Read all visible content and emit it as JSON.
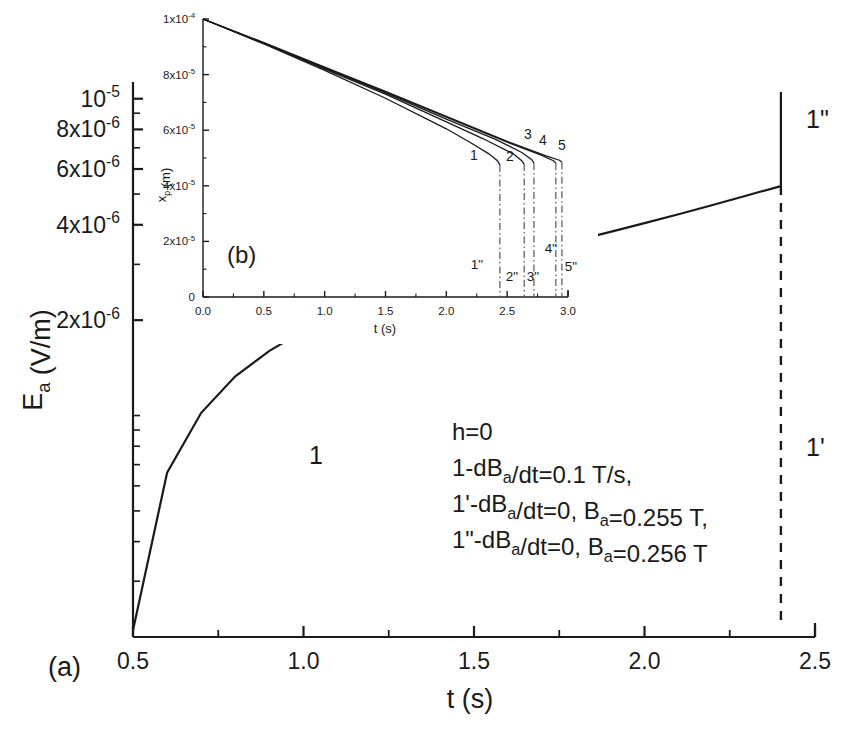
{
  "figure": {
    "panel_a_label": "(a)",
    "panel_b_label": "(b)"
  },
  "main": {
    "xlabel": "t (s)",
    "ylabel_main": "E",
    "ylabel_sub": "a",
    "ylabel_unit": " (V/m)",
    "xticks": [
      "0.5",
      "1.0",
      "1.5",
      "2.0",
      "2.5"
    ],
    "yticks": [
      {
        "label_mant": "2x10",
        "label_exp": "-6"
      },
      {
        "label_mant": "4x10",
        "label_exp": "-6"
      },
      {
        "label_mant": "6x10",
        "label_exp": "-6"
      },
      {
        "label_mant": "8x10",
        "label_exp": "-6"
      },
      {
        "label_mant": "10",
        "label_exp": "-5"
      }
    ],
    "curve_labels": {
      "one": "1",
      "one_prime": "1'",
      "one_dprime": "1\""
    },
    "annotation": [
      "h=0",
      "1-dB|a|/dt=0.1 T/s,",
      "1'-dB|a|/dt=0, B|a|=0.255 T,",
      "1\"-dB|a|/dt=0, B|a|=0.256 T"
    ]
  },
  "inset": {
    "xlabel": "t (s)",
    "ylabel_main": "x",
    "ylabel_sub": "p",
    "ylabel_unit": " (m)",
    "xticks": [
      "0.0",
      "0.5",
      "1.0",
      "1.5",
      "2.0",
      "2.5",
      "3.0"
    ],
    "yticks": [
      {
        "label": "0",
        "mant": "0",
        "exp": ""
      },
      {
        "label": "2x10-5",
        "mant": "2x10",
        "exp": "-5"
      },
      {
        "label": "4x10-5",
        "mant": "4x10",
        "exp": "-5"
      },
      {
        "label": "6x10-5",
        "mant": "6x10",
        "exp": "-5"
      },
      {
        "label": "8x10-5",
        "mant": "8x10",
        "exp": "-5"
      },
      {
        "label": "1x10-4",
        "mant": "1x10",
        "exp": "-4"
      }
    ],
    "curve_labels": [
      "1",
      "2",
      "3",
      "4",
      "5"
    ],
    "drop_labels": [
      "1\"",
      "2\"",
      "3\"",
      "4\"",
      "5\""
    ]
  },
  "colors": {
    "ink": "#1a1a1a",
    "dashdot": "#555555",
    "background": "#ffffff"
  },
  "chart_data": {
    "type": "line",
    "title": "",
    "panels": [
      {
        "id": "a",
        "label": "(a)",
        "xlabel": "t (s)",
        "ylabel": "E_a (V/m)",
        "xscale": "linear",
        "yscale": "log",
        "xlim": [
          0.5,
          2.5
        ],
        "ylim": [
          2e-07,
          1.05e-05
        ],
        "grid": false,
        "legend": "inline-curve-labels",
        "series": [
          {
            "name": "1",
            "note": "dB_a/dt = 0.1 T/s",
            "style": "solid",
            "x": [
              0.5,
              0.6,
              0.7,
              0.8,
              0.9,
              1.0,
              1.1,
              1.2,
              1.3,
              1.4,
              1.5,
              1.6,
              1.7,
              1.8,
              1.9,
              2.0,
              2.1,
              2.2,
              2.3,
              2.4
            ],
            "y": [
              2.1e-07,
              6.6e-07,
              1.02e-06,
              1.33e-06,
              1.6e-06,
              1.85e-06,
              2.08e-06,
              2.3e-06,
              2.51e-06,
              2.72e-06,
              2.93e-06,
              3.14e-06,
              3.35e-06,
              3.57e-06,
              3.8e-06,
              4.05e-06,
              4.32e-06,
              4.62e-06,
              4.95e-06,
              5.3e-06
            ]
          },
          {
            "name": "1'",
            "note": "dB_a/dt=0, B_a=0.255 T",
            "style": "dashed",
            "x": [
              2.4,
              2.4
            ],
            "y": [
              5.3e-06,
              2.2e-07
            ]
          },
          {
            "name": "1\"",
            "note": "dB_a/dt=0, B_a=0.256 T",
            "style": "solid",
            "x": [
              2.4,
              2.4
            ],
            "y": [
              5.3e-06,
              1.05e-05
            ]
          }
        ],
        "annotations": [
          "h=0",
          "1-dB_a/dt=0.1 T/s,",
          "1'-dB_a/dt=0, B_a=0.255 T,",
          "1\"-dB_a/dt=0, B_a=0.256 T"
        ]
      },
      {
        "id": "b",
        "label": "(b)",
        "xlabel": "t (s)",
        "ylabel": "x_p (m)",
        "xscale": "linear",
        "yscale": "linear",
        "xlim": [
          0.0,
          3.0
        ],
        "ylim": [
          0.0,
          0.0001
        ],
        "grid": false,
        "legend": "inline-curve-labels",
        "series": [
          {
            "name": "1",
            "style": "solid",
            "x": [
              0.0,
              0.5,
              1.0,
              1.5,
              2.0,
              2.2,
              2.35,
              2.42,
              2.44
            ],
            "y": [
              0.0001,
              9.1e-05,
              8.15e-05,
              7.15e-05,
              6.05e-05,
              5.55e-05,
              5.15e-05,
              4.9e-05,
              4.75e-05
            ]
          },
          {
            "name": "2",
            "style": "solid",
            "x": [
              0.0,
              0.5,
              1.0,
              1.5,
              2.0,
              2.3,
              2.55,
              2.62,
              2.64
            ],
            "y": [
              0.0001,
              9.12e-05,
              8.2e-05,
              7.3e-05,
              6.3e-05,
              5.7e-05,
              5.15e-05,
              4.9e-05,
              4.78e-05
            ]
          },
          {
            "name": "3",
            "style": "solid",
            "x": [
              0.0,
              0.5,
              1.0,
              1.5,
              2.0,
              2.4,
              2.62,
              2.7,
              2.72
            ],
            "y": [
              0.0001,
              9.13e-05,
              8.23e-05,
              7.34e-05,
              6.4e-05,
              5.68e-05,
              5.2e-05,
              4.95e-05,
              4.82e-05
            ]
          },
          {
            "name": "4",
            "style": "solid",
            "x": [
              0.0,
              0.5,
              1.0,
              1.5,
              2.0,
              2.5,
              2.78,
              2.88,
              2.9
            ],
            "y": [
              0.0001,
              9.14e-05,
              8.25e-05,
              7.37e-05,
              6.47e-05,
              5.57e-05,
              5.1e-05,
              4.9e-05,
              4.82e-05
            ]
          },
          {
            "name": "5",
            "style": "solid",
            "x": [
              0.0,
              0.5,
              1.0,
              1.5,
              2.0,
              2.5,
              2.82,
              2.93,
              2.95
            ],
            "y": [
              0.0001,
              9.15e-05,
              8.27e-05,
              7.4e-05,
              6.5e-05,
              5.6e-05,
              5.08e-05,
              4.92e-05,
              4.85e-05
            ]
          },
          {
            "name": "1\"",
            "style": "dash-dot",
            "x": [
              2.44,
              2.44
            ],
            "y": [
              4.75e-05,
              0.0
            ]
          },
          {
            "name": "2\"",
            "style": "dash-dot",
            "x": [
              2.64,
              2.64
            ],
            "y": [
              4.78e-05,
              0.0
            ]
          },
          {
            "name": "3\"",
            "style": "dash-dot",
            "x": [
              2.72,
              2.72
            ],
            "y": [
              4.82e-05,
              0.0
            ]
          },
          {
            "name": "4\"",
            "style": "dash-dot",
            "x": [
              2.9,
              2.9
            ],
            "y": [
              4.82e-05,
              0.0
            ]
          },
          {
            "name": "5\"",
            "style": "dash-dot",
            "x": [
              2.95,
              2.95
            ],
            "y": [
              4.85e-05,
              0.0
            ]
          }
        ]
      }
    ]
  }
}
